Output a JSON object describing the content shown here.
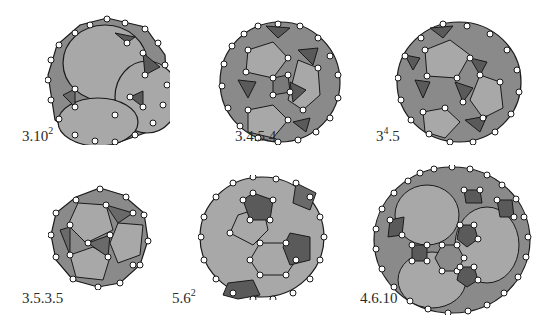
{
  "figure": {
    "colors": {
      "background": "#ffffff",
      "face_light": "#a8a8a8",
      "face_mid": "#8a8a8a",
      "face_dark": "#5a5a5a",
      "edge": "#1a1a1a",
      "vertex_fill": "#ffffff"
    },
    "items": [
      {
        "id": "truncated-cube",
        "label_base": "3.10",
        "label_sup": "2",
        "label_tail": ""
      },
      {
        "id": "rhombicosidodecahedron",
        "label_base": "3.4.5.4",
        "label_sup": "",
        "label_tail": ""
      },
      {
        "id": "snub-dodecahedron",
        "label_base": "3",
        "label_sup": "4",
        "label_tail": ".5"
      },
      {
        "id": "icosidodecahedron",
        "label_base": "3.5.3.5",
        "label_sup": "",
        "label_tail": ""
      },
      {
        "id": "truncated-icosahedron",
        "label_base": "5.6",
        "label_sup": "2",
        "label_tail": ""
      },
      {
        "id": "truncated-icosidodecahedron",
        "label_base": "4.6.10",
        "label_sup": "",
        "label_tail": ""
      }
    ]
  }
}
